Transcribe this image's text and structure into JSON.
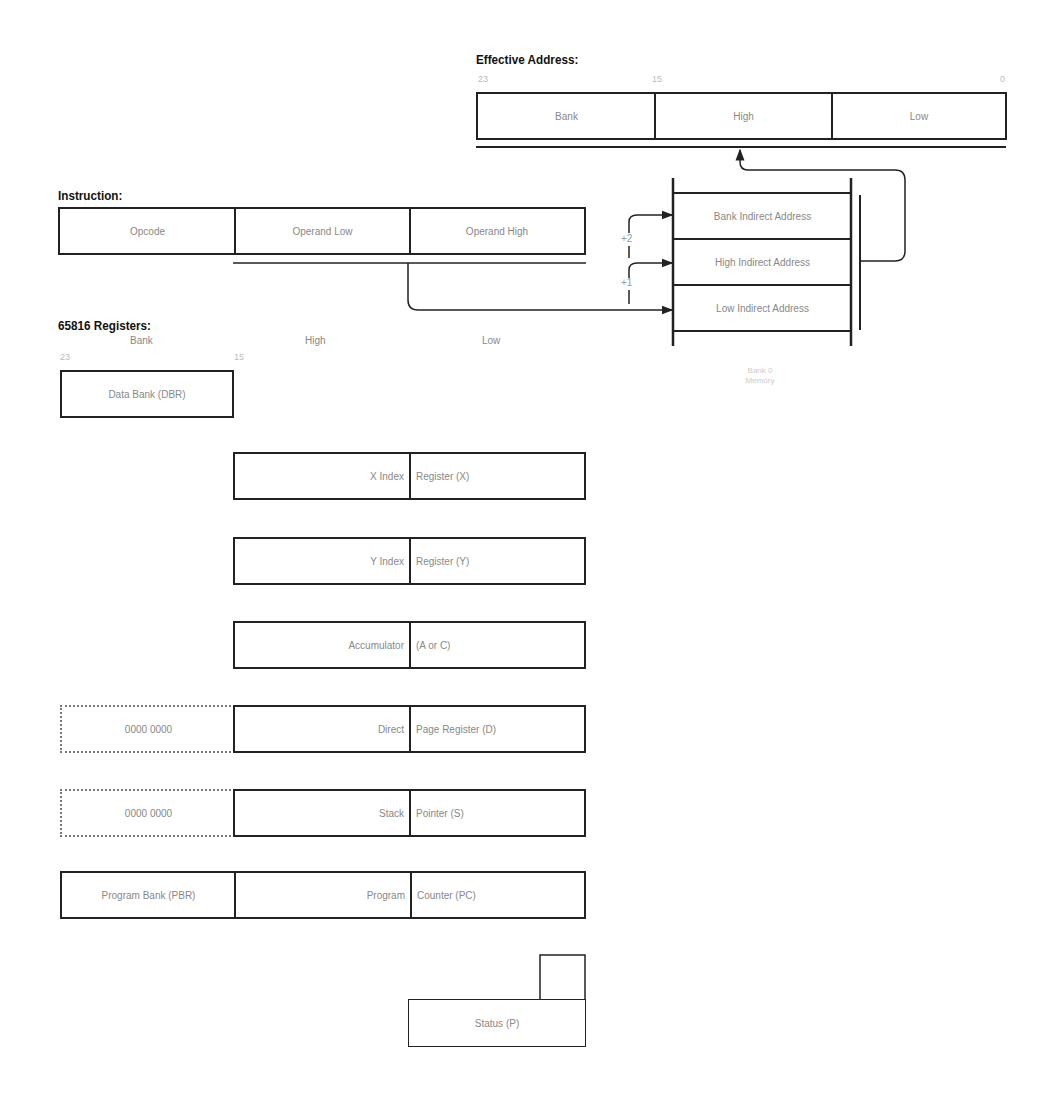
{
  "effective_address": {
    "title": "Effective Address:",
    "ticks": [
      "23",
      "15",
      "0"
    ],
    "fields": [
      "Bank",
      "High",
      "Low"
    ]
  },
  "instruction": {
    "title": "Instruction:",
    "fields": [
      "Opcode",
      "Operand Low",
      "Operand High"
    ]
  },
  "memory": {
    "cells": [
      "Bank Indirect Address",
      "High Indirect Address",
      "Low Indirect Address"
    ],
    "offsets": [
      "+2",
      "+1"
    ],
    "caption_line1": "Bank 0",
    "caption_line2": "Memory"
  },
  "registers": {
    "title": "65816 Registers:",
    "columns": [
      "Bank",
      "High",
      "Low"
    ],
    "ticks": [
      "23",
      "15"
    ],
    "dbr": "Data Bank (DBR)",
    "x_index": {
      "left": "X Index",
      "right": "Register (X)"
    },
    "y_index": {
      "left": "Y Index",
      "right": "Register (Y)"
    },
    "accumulator": {
      "left": "Accumulator",
      "right": "(A or C)"
    },
    "direct_page": {
      "bank": "0000 0000",
      "left": "Direct",
      "right": "Page Register (D)"
    },
    "stack_pointer": {
      "bank": "0000 0000",
      "left": "Stack",
      "right": "Pointer (S)"
    },
    "program_counter": {
      "bank": "Program Bank (PBR)",
      "left": "Program",
      "right": "Counter (PC)"
    },
    "status": "Status (P)"
  }
}
